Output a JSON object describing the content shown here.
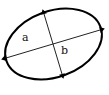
{
  "figure": {
    "name": "ellipse-semi-axes-diagram",
    "background_color": "#ffffff",
    "stroke_color": "#000000",
    "labels": {
      "semi_major": "a",
      "semi_minor": "b"
    },
    "ellipse": {
      "center_x": 53.5,
      "center_y": 44,
      "radius_x": 50,
      "radius_y": 33,
      "rotation_deg": -20,
      "stroke_width": 2
    },
    "arrows": [
      {
        "name": "semi-major-axis-arrow",
        "label": "a",
        "x1": 6,
        "y1": 58,
        "x2": 100,
        "y2": 30,
        "double_headed": true,
        "stroke_width": 1
      },
      {
        "name": "semi-minor-axis-arrow",
        "label": "b",
        "x1": 44,
        "y1": 14,
        "x2": 62,
        "y2": 74,
        "double_headed": true,
        "stroke_width": 1
      }
    ]
  }
}
